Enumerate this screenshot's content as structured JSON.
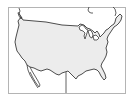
{
  "map": {
    "subject": "Continental United States outline",
    "colors": {
      "background": "#ffffff",
      "frame": "#b4b4b4",
      "us_fill": "#ececec",
      "outline": "#3a3a3a"
    },
    "regions": [
      {
        "name": "United States",
        "filled": true
      },
      {
        "name": "Canada",
        "filled": false
      },
      {
        "name": "Mexico",
        "filled": false
      }
    ]
  }
}
